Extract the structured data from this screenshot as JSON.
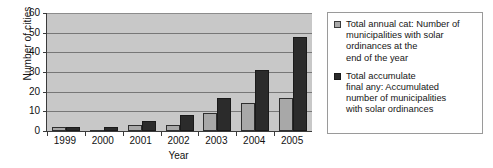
{
  "chart_data": {
    "type": "bar",
    "title": "",
    "subtitle": "",
    "xlabel": "Year",
    "ylabel": "Number of cities",
    "categories": [
      "1999",
      "2000",
      "2001",
      "2002",
      "2003",
      "2004",
      "2005"
    ],
    "ylim": [
      0,
      60
    ],
    "yticks": [
      0,
      10,
      20,
      30,
      40,
      50,
      60
    ],
    "ytick_labels": [
      "0",
      "10",
      "20",
      "30",
      "40",
      "50",
      "60"
    ],
    "grid": true,
    "grid_axis": "y",
    "legend_position": "right-outside",
    "series": [
      {
        "name": "Total annual cat: Number of municipalities with solar ordinances at the end of the year",
        "color": "#a8a8a8",
        "values": [
          2,
          0,
          3,
          3,
          9,
          14,
          17
        ]
      },
      {
        "name": "Total accumulate final any: Accumulated number of municipalities with solar ordinances",
        "color": "#2b2b2b",
        "values": [
          2,
          2,
          5,
          8,
          17,
          31,
          48
        ]
      }
    ],
    "annotations": []
  },
  "legend": {
    "entries": [
      {
        "swatch": "light",
        "lines": [
          "Total annual cat: Number of",
          "municipalities with solar",
          "ordinances at the",
          "end of the year"
        ]
      },
      {
        "swatch": "dark",
        "lines": [
          "Total accumulate",
          "final any: Accumulated",
          "number of municipalities",
          "with solar ordinances"
        ]
      }
    ]
  },
  "colors": {
    "plot_background": "#c8c8c8",
    "gridline": "#777777",
    "axis": "#3b3b3b",
    "series_light": "#a8a8a8",
    "series_dark": "#2b2b2b",
    "legend_border": "#9a9a9a",
    "page_background": "#ffffff"
  }
}
